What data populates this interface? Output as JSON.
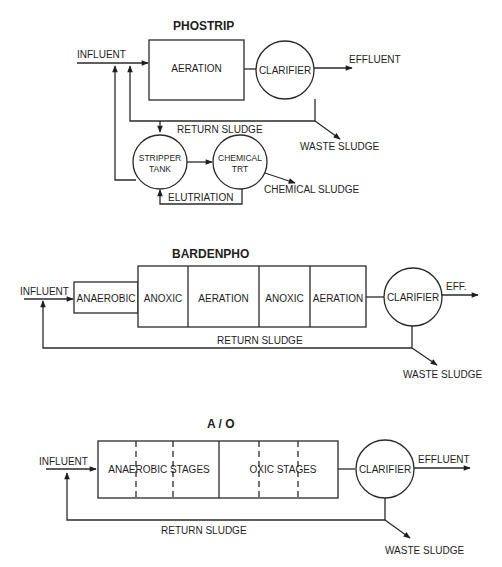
{
  "phostrip": {
    "title": "PHOSTRIP",
    "influent": "INFLUENT",
    "aeration": "AERATION",
    "clarifier": "CLARIFIER",
    "effluent": "EFFLUENT",
    "return_sludge": "RETURN SLUDGE",
    "waste_sludge": "WASTE SLUDGE",
    "stripper_line1": "STRIPPER",
    "stripper_line2": "TANK",
    "chemical_line1": "CHEMICAL",
    "chemical_line2": "TRT",
    "chemical_sludge": "CHEMICAL SLUDGE",
    "elutriation": "ELUTRIATION"
  },
  "bardenpho": {
    "title": "BARDENPHO",
    "influent": "INFLUENT",
    "stages": [
      "ANAEROBIC",
      "ANOXIC",
      "AERATION",
      "ANOXIC",
      "AERATION"
    ],
    "clarifier": "CLARIFIER",
    "effluent": "EFF.",
    "return_sludge": "RETURN SLUDGE",
    "waste_sludge": "WASTE SLUDGE"
  },
  "ao": {
    "title": "A / O",
    "influent": "INFLUENT",
    "anaerobic": "ANAEROBIC STAGES",
    "oxic": "OXIC STAGES",
    "clarifier": "CLARIFIER",
    "effluent": "EFFLUENT",
    "return_sludge": "RETURN SLUDGE",
    "waste_sludge": "WASTE SLUDGE"
  }
}
